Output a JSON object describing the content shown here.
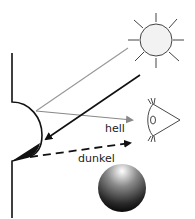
{
  "diagram": {
    "labels": {
      "bright": "hell",
      "dark": "dunkel"
    },
    "icons": {
      "sun": "sun-icon",
      "eye": "eye-icon",
      "sphere": "shaded-sphere"
    },
    "colors": {
      "stroke": "#111111",
      "gray_ray": "#999999",
      "sun_fill": "#f2f2f2"
    }
  }
}
